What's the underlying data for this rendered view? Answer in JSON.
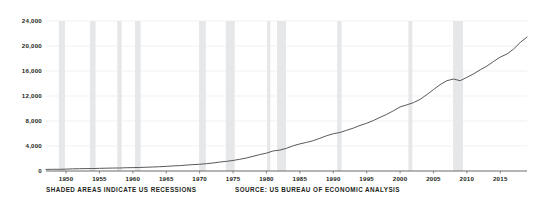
{
  "chart_data": {
    "type": "line",
    "title": "",
    "subtitle": "",
    "xlabel": "",
    "ylabel": "BILLIONS OF DOLLARS",
    "ylim": [
      0,
      24000
    ],
    "xlim": [
      1947,
      2019
    ],
    "grid": true,
    "legend": null,
    "y_ticks": [
      0,
      4000,
      8000,
      12000,
      16000,
      20000,
      24000
    ],
    "y_tick_labels": [
      "0",
      "4,000",
      "8,000",
      "12,000",
      "16,000",
      "20,000",
      "24,000"
    ],
    "x_ticks": [
      1950,
      1955,
      1960,
      1965,
      1970,
      1975,
      1980,
      1985,
      1990,
      1995,
      2000,
      2005,
      2010,
      2015
    ],
    "x_tick_labels": [
      "1950",
      "1955",
      "1960",
      "1965",
      "1970",
      "1975",
      "1980",
      "1985",
      "1990",
      "1995",
      "2000",
      "2005",
      "2010",
      "2015"
    ],
    "series": [
      {
        "name": "Gross Domestic Product",
        "color": "#58595b",
        "x": [
          1947,
          1948,
          1949,
          1950,
          1951,
          1952,
          1953,
          1954,
          1955,
          1956,
          1957,
          1958,
          1959,
          1960,
          1961,
          1962,
          1963,
          1964,
          1965,
          1966,
          1967,
          1968,
          1969,
          1970,
          1971,
          1972,
          1973,
          1974,
          1975,
          1976,
          1977,
          1978,
          1979,
          1980,
          1981,
          1982,
          1983,
          1984,
          1985,
          1986,
          1987,
          1988,
          1989,
          1990,
          1991,
          1992,
          1993,
          1994,
          1995,
          1996,
          1997,
          1998,
          1999,
          2000,
          2001,
          2002,
          2003,
          2004,
          2005,
          2006,
          2007,
          2008,
          2009,
          2010,
          2011,
          2012,
          2013,
          2014,
          2015,
          2016,
          2017,
          2018,
          2019
        ],
        "y": [
          249,
          274,
          272,
          300,
          347,
          367,
          389,
          391,
          426,
          450,
          474,
          482,
          522,
          543,
          563,
          605,
          638,
          685,
          743,
          815,
          862,
          943,
          1020,
          1076,
          1168,
          1282,
          1429,
          1545,
          1685,
          1873,
          2082,
          2352,
          2627,
          2857,
          3207,
          3344,
          3634,
          4038,
          4339,
          4580,
          4855,
          5236,
          5642,
          5963,
          6158,
          6520,
          6859,
          7287,
          7640,
          8073,
          8578,
          9063,
          9631,
          10251,
          10582,
          10936,
          11458,
          12214,
          13037,
          13815,
          14452,
          14713,
          14449,
          14992,
          15543,
          16197,
          16785,
          17527,
          18225,
          18715,
          19519,
          20580,
          21428
        ]
      }
    ],
    "shaded_regions": {
      "label": "US recessions",
      "color": "#e6e7e8",
      "spans": [
        [
          1948.92,
          1949.83
        ],
        [
          1953.58,
          1954.42
        ],
        [
          1957.67,
          1958.33
        ],
        [
          1960.33,
          1961.17
        ],
        [
          1969.92,
          1970.92
        ],
        [
          1973.92,
          1975.25
        ],
        [
          1980.08,
          1980.58
        ],
        [
          1981.58,
          1982.92
        ],
        [
          1990.58,
          1991.25
        ],
        [
          2001.25,
          2001.83
        ],
        [
          2007.92,
          2009.42
        ]
      ]
    },
    "annotations": {
      "recession_note": "SHADED AREAS INDICATE US RECESSIONS",
      "source": "SOURCE: US BUREAU OF ECONOMIC ANALYSIS"
    },
    "colors": {
      "line": "#58595b",
      "grid": "#edeef0",
      "axis": "#58595b",
      "shade": "#e6e7e8",
      "text": "#231f20",
      "background": "#ffffff"
    }
  }
}
